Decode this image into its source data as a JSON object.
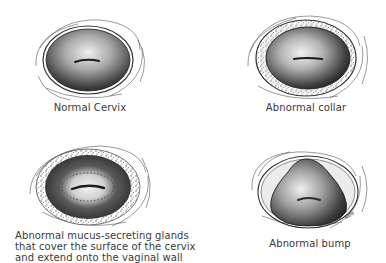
{
  "figure": {
    "panels": [
      {
        "id": "normal",
        "label": "Normal Cervix"
      },
      {
        "id": "collar",
        "label": "Abnormal collar"
      },
      {
        "id": "mucus",
        "label_lines": [
          "Abnormal mucus-secreting glands",
          "that cover the surface of the cervix",
          "and extend onto the vaginal wall"
        ]
      },
      {
        "id": "bump",
        "label": "Abnormal bump"
      }
    ],
    "signature": "NBR",
    "colors": {
      "background": "#ffffff",
      "ink": "#2a2a2a",
      "tissue_dark": "#3c3c3c",
      "tissue_light": "#e2e2e2",
      "label": "#3a3a3a"
    }
  }
}
